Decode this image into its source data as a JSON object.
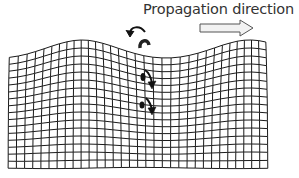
{
  "diagram": {
    "type": "surface-wave-deformation",
    "label": "Propagation direction",
    "colors": {
      "grid": "#1a1a1a",
      "arrow_fill": "#f2f2f2",
      "arrow_stroke": "#555555",
      "text": "#333333",
      "motion_arrows": "#111111"
    },
    "icons": {
      "propagation_arrow": "hollow-right-arrow-icon",
      "rotation_arrow": "counterclockwise-arrow-icon",
      "particle_motion": "down-arrow-icon"
    }
  }
}
